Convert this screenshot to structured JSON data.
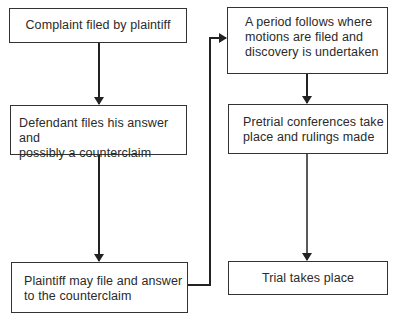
{
  "diagram": {
    "type": "flowchart",
    "nodes": [
      {
        "id": "complaint",
        "lines": [
          "Complaint filed by plaintiff"
        ]
      },
      {
        "id": "defendant_answer",
        "lines": [
          "Defendant files his answer and",
          "possibly a counterclaim"
        ]
      },
      {
        "id": "plaintiff_reply",
        "lines": [
          "Plaintiff may file and answer",
          "to the counterclaim"
        ]
      },
      {
        "id": "discovery",
        "lines": [
          "A period follows where",
          "motions are filed and",
          "discovery is undertaken"
        ]
      },
      {
        "id": "pretrial",
        "lines": [
          "Pretrial conferences take",
          "place and rulings made"
        ]
      },
      {
        "id": "trial",
        "lines": [
          "Trial takes place"
        ]
      }
    ],
    "edges": [
      {
        "from": "complaint",
        "to": "defendant_answer"
      },
      {
        "from": "defendant_answer",
        "to": "plaintiff_reply"
      },
      {
        "from": "plaintiff_reply",
        "to": "discovery"
      },
      {
        "from": "discovery",
        "to": "pretrial"
      },
      {
        "from": "pretrial",
        "to": "trial"
      }
    ]
  }
}
